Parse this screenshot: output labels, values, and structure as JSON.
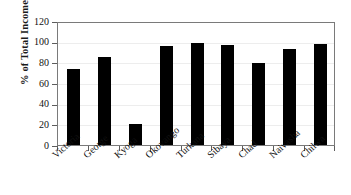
{
  "chart_data": {
    "type": "bar",
    "title": "",
    "subtitle": "",
    "xlabel": "",
    "ylabel": "% of Total Income",
    "categories": [
      "Victoria",
      "George",
      "Kyoga",
      "Okovango",
      "Turkana",
      "Sibaya",
      "Chad",
      "Naivasha",
      "Chilwa"
    ],
    "values": [
      74,
      85,
      20,
      96,
      99,
      97,
      79,
      93,
      98
    ],
    "ylim": [
      0,
      120
    ],
    "ytick_values": [
      0,
      20,
      40,
      60,
      80,
      100,
      120
    ],
    "ytick_labels": [
      "0",
      "20",
      "40",
      "60",
      "80",
      "100",
      "120"
    ],
    "grid": true,
    "legend": false,
    "bar_color": "#000000",
    "axis_color": "#7a7a7a",
    "gridline_color": "#ededed",
    "background": "#ffffff",
    "series": [
      {
        "name": "% of Total Income",
        "values": [
          74,
          85,
          20,
          96,
          99,
          97,
          79,
          93,
          98
        ]
      }
    ]
  }
}
